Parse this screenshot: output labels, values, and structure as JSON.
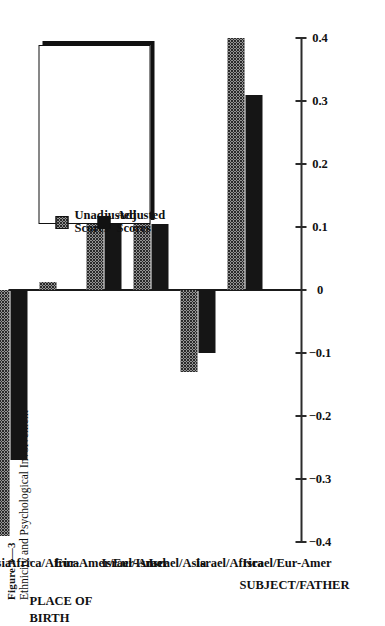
{
  "figure": {
    "number": "Figure 3—3",
    "subtitle": "Ethnicity and Psychological Involvement"
  },
  "legend": {
    "items": [
      {
        "label": "Unadjusted\nScores",
        "label_line1": "Unadjusted",
        "label_line2": "Scores",
        "pattern": "dotted",
        "color": "#2a2a2a"
      },
      {
        "label": "Adjusted\nScores",
        "label_line1": "Adjusted",
        "label_line2": "Scores",
        "pattern": "solid",
        "color": "#151515"
      }
    ]
  },
  "groups": [
    {
      "header": "SUBJECT/FATHER",
      "categories": [
        "Israel/Eur-Amer",
        "Israel/Africa",
        "Israel/Asia",
        "Israel/Israel"
      ]
    },
    {
      "header": "PLACE OF\nBIRTH",
      "header_line1": "PLACE OF",
      "header_line2": "BIRTH",
      "categories": [
        "Eur-Amer/Eur-Amer",
        "Africa/Africa",
        "Asia/Asia"
      ]
    }
  ],
  "chart_data": {
    "type": "bar",
    "orientation": "horizontal",
    "title": "Ethnicity and Psychological Involvement",
    "xlabel": "",
    "ylabel": "",
    "xlim": [
      -0.4,
      0.4
    ],
    "grid": false,
    "legend_position": "center-right",
    "tick_labels": [
      "−0.4",
      "−0.3",
      "−0.2",
      "−0.1",
      "0",
      "0.1",
      "0.2",
      "0.3",
      "0.4"
    ],
    "ticks": [
      -0.4,
      -0.3,
      -0.2,
      -0.1,
      0,
      0.1,
      0.2,
      0.3,
      0.4
    ],
    "categories": [
      "Israel/Eur-Amer",
      "Israel/Africa",
      "Israel/Asia",
      "Israel/Israel",
      "Eur-Amer/Eur-Amer",
      "Africa/Africa",
      "Asia/Asia"
    ],
    "series": [
      {
        "name": "Unadjusted Scores",
        "values": [
          0.4,
          -0.13,
          0.14,
          0.33,
          0.012,
          -0.39,
          -0.34
        ]
      },
      {
        "name": "Adjusted Scores",
        "values": [
          0.31,
          -0.1,
          0.105,
          0.255,
          0.0,
          -0.27,
          -0.265
        ]
      }
    ]
  }
}
